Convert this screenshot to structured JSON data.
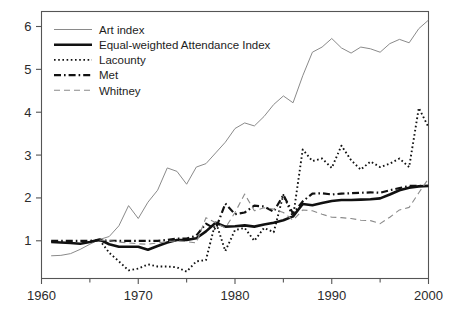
{
  "chart_data": {
    "type": "line",
    "title": "",
    "xlabel": "",
    "ylabel": "",
    "xlim": [
      1960,
      2000
    ],
    "ylim": [
      0.12,
      6.35
    ],
    "grid": false,
    "legend_position": "top-left",
    "x_ticks_major": [
      1960,
      1970,
      1980,
      1990,
      2000
    ],
    "x_ticks_minor": [
      1965,
      1975,
      1985,
      1995
    ],
    "x_tick_labels": [
      "1960",
      "1970",
      "1980",
      "1990",
      "2000"
    ],
    "y_ticks": [
      1,
      2,
      3,
      4,
      5,
      6
    ],
    "y_tick_labels": [
      "1",
      "2",
      "3",
      "4",
      "5",
      "6"
    ],
    "series": [
      {
        "name": "Art index",
        "style": "solid-thin",
        "color": "#8a8a8a",
        "width": 1.0,
        "dash": "",
        "x": [
          1961,
          1962,
          1963,
          1964,
          1965,
          1966,
          1967,
          1968,
          1969,
          1970,
          1971,
          1972,
          1973,
          1974,
          1975,
          1976,
          1977,
          1978,
          1979,
          1980,
          1981,
          1982,
          1983,
          1984,
          1985,
          1986,
          1987,
          1988,
          1989,
          1990,
          1991,
          1992,
          1993,
          1994,
          1995,
          1996,
          1997,
          1998,
          1999,
          2000
        ],
        "values": [
          0.65,
          0.66,
          0.7,
          0.8,
          0.92,
          1.03,
          1.1,
          1.35,
          1.82,
          1.52,
          1.9,
          2.18,
          2.7,
          2.62,
          2.32,
          2.72,
          2.8,
          3.05,
          3.3,
          3.62,
          3.75,
          3.68,
          3.9,
          4.18,
          4.38,
          4.22,
          4.85,
          5.4,
          5.52,
          5.72,
          5.5,
          5.38,
          5.52,
          5.48,
          5.4,
          5.6,
          5.7,
          5.62,
          5.95,
          6.15
        ]
      },
      {
        "name": "Equal-weighted Attendance Index",
        "style": "solid-thick",
        "color": "#111111",
        "width": 2.6,
        "dash": "",
        "x": [
          1961,
          1962,
          1963,
          1964,
          1965,
          1966,
          1967,
          1968,
          1969,
          1970,
          1971,
          1972,
          1973,
          1974,
          1975,
          1976,
          1977,
          1978,
          1979,
          1980,
          1981,
          1982,
          1983,
          1984,
          1985,
          1986,
          1987,
          1988,
          1989,
          1990,
          1991,
          1992,
          1993,
          1994,
          1995,
          1996,
          1997,
          1998,
          1999,
          2000
        ],
        "values": [
          0.97,
          0.96,
          0.95,
          0.93,
          0.97,
          1.03,
          0.92,
          0.86,
          0.86,
          0.86,
          0.79,
          0.88,
          0.96,
          1.02,
          1.02,
          1.06,
          1.22,
          1.42,
          1.33,
          1.34,
          1.36,
          1.33,
          1.38,
          1.42,
          1.48,
          1.57,
          1.86,
          1.83,
          1.88,
          1.93,
          1.95,
          1.95,
          1.96,
          1.97,
          1.99,
          2.08,
          2.18,
          2.24,
          2.27,
          2.28
        ]
      },
      {
        "name": "Lacounty",
        "style": "dotted",
        "color": "#111111",
        "width": 1.9,
        "dash": "1.6 2.6",
        "x": [
          1966,
          1967,
          1968,
          1969,
          1970,
          1971,
          1972,
          1973,
          1974,
          1975,
          1976,
          1977,
          1978,
          1979,
          1980,
          1981,
          1982,
          1983,
          1984,
          1985,
          1986,
          1987,
          1988,
          1989,
          1990,
          1991,
          1992,
          1993,
          1994,
          1995,
          1996,
          1997,
          1998,
          1999,
          2000
        ],
        "values": [
          1.02,
          0.72,
          0.52,
          0.31,
          0.35,
          0.45,
          0.4,
          0.4,
          0.38,
          0.28,
          0.52,
          0.55,
          1.45,
          0.76,
          1.25,
          1.3,
          1.0,
          1.3,
          1.2,
          2.07,
          1.55,
          3.13,
          2.86,
          2.92,
          2.7,
          3.22,
          2.88,
          2.66,
          2.85,
          2.72,
          2.8,
          2.92,
          2.72,
          4.1,
          3.65
        ]
      },
      {
        "name": "Met",
        "style": "dash-dot",
        "color": "#111111",
        "width": 2.2,
        "dash": "7 3 1.6 3",
        "x": [
          1961,
          1962,
          1963,
          1964,
          1965,
          1966,
          1967,
          1968,
          1969,
          1970,
          1971,
          1972,
          1973,
          1974,
          1975,
          1976,
          1977,
          1978,
          1979,
          1980,
          1981,
          1982,
          1983,
          1984,
          1985,
          1986,
          1987,
          1988,
          1989,
          1990,
          1991,
          1992,
          1993,
          1994,
          1995,
          1996,
          1997,
          1998,
          1999,
          2000
        ],
        "values": [
          1.0,
          1.0,
          1.0,
          1.0,
          1.0,
          1.01,
          1.0,
          1.0,
          1.0,
          1.0,
          1.0,
          1.0,
          1.02,
          1.05,
          1.05,
          1.12,
          1.4,
          1.27,
          1.87,
          1.62,
          1.66,
          1.82,
          1.8,
          1.68,
          2.07,
          1.63,
          1.92,
          2.1,
          2.11,
          2.08,
          2.1,
          2.11,
          2.12,
          2.13,
          2.12,
          2.18,
          2.23,
          2.28,
          2.28,
          2.28
        ]
      },
      {
        "name": "Whitney",
        "style": "dashed-thin",
        "color": "#8a8a8a",
        "width": 1.1,
        "dash": "6 4",
        "x": [
          1966,
          1967,
          1968,
          1969,
          1970,
          1971,
          1972,
          1973,
          1974,
          1975,
          1976,
          1977,
          1978,
          1979,
          1980,
          1981,
          1982,
          1983,
          1984,
          1985,
          1986,
          1987,
          1988,
          1989,
          1990,
          1991,
          1992,
          1993,
          1994,
          1995,
          1996,
          1997,
          1998,
          1999,
          2000
        ],
        "values": [
          1.02,
          1.0,
          0.97,
          0.95,
          0.93,
          0.92,
          0.95,
          0.98,
          1.0,
          0.98,
          0.95,
          1.54,
          1.42,
          1.3,
          1.66,
          2.09,
          1.7,
          1.77,
          1.74,
          1.66,
          1.48,
          1.72,
          1.7,
          1.62,
          1.55,
          1.54,
          1.52,
          1.48,
          1.47,
          1.4,
          1.55,
          1.72,
          1.78,
          2.12,
          2.45
        ]
      }
    ],
    "legend_entries": [
      {
        "label": "Art index"
      },
      {
        "label": "Equal-weighted Attendance Index"
      },
      {
        "label": "Lacounty"
      },
      {
        "label": "Met"
      },
      {
        "label": "Whitney"
      }
    ]
  }
}
